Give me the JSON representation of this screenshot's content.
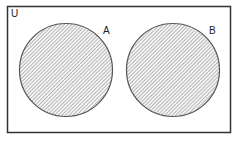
{
  "diagram": {
    "type": "venn",
    "universe_label": "U",
    "sets": [
      {
        "label": "A",
        "shaded": true
      },
      {
        "label": "B",
        "shaded": true
      }
    ],
    "relationship": "disjoint",
    "colors": {
      "border": "#333333",
      "circle_stroke": "#555555",
      "hatch": "#8a8a8a",
      "background": "#ffffff"
    }
  }
}
